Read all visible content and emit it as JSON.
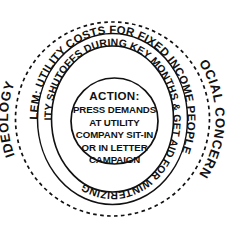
{
  "diagram": {
    "type": "concentric-circles",
    "title_visible": false,
    "colors": {
      "ink": "#111111",
      "background": "#ffffff"
    },
    "rings": [
      {
        "id": "ideology",
        "level": 1,
        "style": "dashed",
        "labels": [
          {
            "id": "ideology-label",
            "text": "IDEOLOGY",
            "position": "left"
          },
          {
            "id": "social-concerns-label",
            "text": "SOCIAL CONCERNS",
            "position": "right"
          }
        ]
      },
      {
        "id": "problem",
        "level": 2,
        "style": "solid",
        "labels": [
          {
            "id": "problem-label",
            "text": "PROBLEM: UTILITY COSTS FOR FIXED INCOME PEOPLE",
            "position": "top-clockwise"
          }
        ]
      },
      {
        "id": "issues",
        "level": 3,
        "style": "solid",
        "labels": [
          {
            "id": "issues-label",
            "text": "ISSUES: SECURE NO UTILITY SHUTOFFS DURING KEY MONTHS & GET AID FOR WINTERIZING",
            "position": "top-clockwise"
          }
        ]
      }
    ],
    "core": {
      "id": "action",
      "style": "solid",
      "heading": "ACTION:",
      "lines": [
        "PRESS DEMANDS",
        "AT UTILITY",
        "COMPANY SIT-IN",
        "OR IN LETTER",
        "CAMPAIGN"
      ]
    }
  }
}
